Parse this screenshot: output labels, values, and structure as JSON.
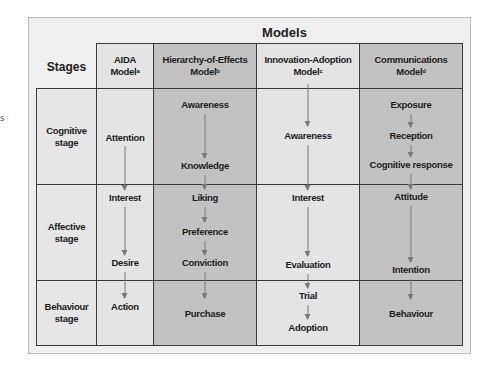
{
  "edge_fragment": "s",
  "title": "Models",
  "stages_label": "Stages",
  "columns": [
    {
      "name": "AIDA",
      "line2": "Model",
      "sup": "a"
    },
    {
      "name": "Hierarchy-of-Effects",
      "line2": "Model",
      "sup": "b"
    },
    {
      "name": "Innovation-Adoption",
      "line2": "Model",
      "sup": "c"
    },
    {
      "name": "Communications",
      "line2": "Model",
      "sup": "d"
    }
  ],
  "stages": [
    {
      "line1": "Cognitive",
      "line2": "stage"
    },
    {
      "line1": "Affective",
      "line2": "stage"
    },
    {
      "line1": "Behaviour",
      "line2": "stage"
    }
  ],
  "models": {
    "aida": [
      "Attention",
      "Interest",
      "Desire",
      "Action"
    ],
    "hierarchy": [
      "Awareness",
      "Knowledge",
      "Liking",
      "Preference",
      "Conviction",
      "Purchase"
    ],
    "innovation": [
      "Awareness",
      "Interest",
      "Evaluation",
      "Trial",
      "Adoption"
    ],
    "communications": [
      "Exposure",
      "Reception",
      "Cognitive response",
      "Attitude",
      "Intention",
      "Behaviour"
    ]
  },
  "colors": {
    "light_cell": "#e4e4e4",
    "dark_cell": "#c2c2c2",
    "arrow": "#7a7a7a",
    "grid_line": "#3a3a3a"
  }
}
